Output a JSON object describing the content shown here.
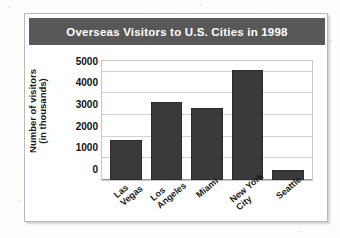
{
  "card": {
    "title": "Overseas Visitors to U.S. Cities in 1998"
  },
  "axis": {
    "y_title_line1": "Number of visitors",
    "y_title_line2": "(in thousands)"
  },
  "colors": {
    "title_bar": "#585858",
    "bar_fill": "#3a3a3a",
    "gridline": "#d2d2d2",
    "card_border": "#b9b9b9"
  },
  "chart_data": {
    "type": "bar",
    "title": "Overseas Visitors to U.S. Cities in 1998",
    "xlabel": "",
    "ylabel": "Number of visitors (in thousands)",
    "ylim": [
      0,
      5500
    ],
    "yticks": [
      0,
      1000,
      2000,
      3000,
      4000,
      5000
    ],
    "ytick_labels": [
      "0",
      "1000",
      "2000",
      "3000",
      "4000",
      "5000"
    ],
    "grid": true,
    "legend": false,
    "categories": [
      "Las Vegas",
      "Los Angeles",
      "Miami",
      "New York City",
      "Seattle"
    ],
    "category_lines": [
      [
        "Las",
        "Vegas"
      ],
      [
        "Los",
        "Angeles"
      ],
      [
        "Miami"
      ],
      [
        "New York",
        "City"
      ],
      [
        "Seattle"
      ]
    ],
    "values": [
      1850,
      3600,
      3350,
      5100,
      450
    ],
    "series": [
      {
        "name": "Overseas visitors",
        "values": [
          1850,
          3600,
          3350,
          5100,
          450
        ]
      }
    ]
  }
}
